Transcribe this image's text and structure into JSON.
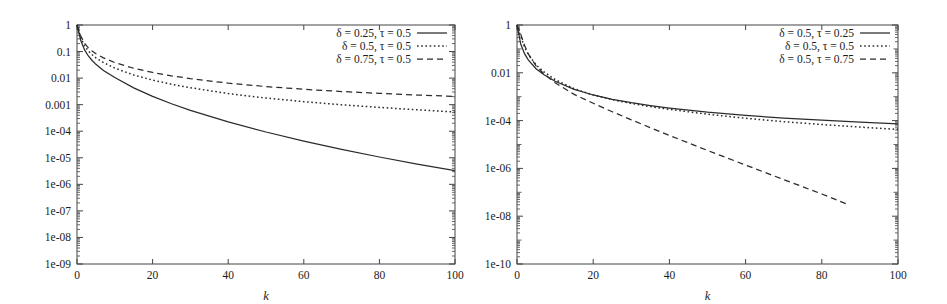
{
  "figure": {
    "background": "#ffffff",
    "ink": "#2b2b2b",
    "panel_count": 2
  },
  "chart_data": [
    {
      "type": "line",
      "id": "left-panel",
      "title": "",
      "xlabel": "k",
      "ylabel": "",
      "xlim": [
        0,
        100
      ],
      "ylim": [
        1e-09,
        1
      ],
      "yscale": "log",
      "grid": false,
      "legend_position": "top-right",
      "xticks": [
        0,
        20,
        40,
        60,
        80,
        100
      ],
      "xtick_labels": [
        "0",
        "20",
        "40",
        "60",
        "80",
        "100"
      ],
      "yticks": [
        1,
        0.1,
        0.01,
        0.001,
        0.0001,
        1e-05,
        1e-06,
        1e-07,
        1e-08,
        1e-09
      ],
      "ytick_labels": [
        "1",
        "0.1",
        "0.01",
        "0.001",
        "1e-04",
        "1e-05",
        "1e-06",
        "1e-07",
        "1e-08",
        "1e-09"
      ],
      "series": [
        {
          "name": "δ = 0.25, τ = 0.5",
          "style": "solid",
          "x": [
            0,
            1,
            2,
            3,
            4,
            5,
            7,
            10,
            15,
            20,
            25,
            30,
            40,
            50,
            60,
            70,
            80,
            90,
            100
          ],
          "values": [
            1.0,
            0.26,
            0.115,
            0.068,
            0.046,
            0.033,
            0.0195,
            0.0105,
            0.0043,
            0.00205,
            0.00108,
            0.00061,
            0.000225,
            9.35e-05,
            4.25e-05,
            2.07e-05,
            1.07e-05,
            5.8e-06,
            3.3e-06
          ]
        },
        {
          "name": "δ = 0.5, τ = 0.5",
          "style": "dotted",
          "x": [
            0,
            1,
            2,
            3,
            4,
            5,
            7,
            10,
            15,
            20,
            25,
            30,
            40,
            50,
            60,
            70,
            80,
            90,
            100
          ],
          "values": [
            1.0,
            0.33,
            0.165,
            0.105,
            0.076,
            0.058,
            0.0385,
            0.0238,
            0.0131,
            0.0084,
            0.0059,
            0.00435,
            0.00262,
            0.00178,
            0.0013,
            0.00099,
            0.00079,
            0.00064,
            0.00053
          ]
        },
        {
          "name": "δ = 0.75, τ = 0.5",
          "style": "dashed",
          "x": [
            0,
            1,
            2,
            3,
            4,
            5,
            7,
            10,
            15,
            20,
            25,
            30,
            40,
            50,
            60,
            70,
            80,
            90,
            100
          ],
          "values": [
            1.0,
            0.38,
            0.205,
            0.138,
            0.104,
            0.083,
            0.058,
            0.0385,
            0.0235,
            0.0163,
            0.0122,
            0.0096,
            0.00645,
            0.0048,
            0.0038,
            0.00313,
            0.00266,
            0.00231,
            0.00204
          ]
        }
      ]
    },
    {
      "type": "line",
      "id": "right-panel",
      "title": "",
      "xlabel": "k",
      "ylabel": "",
      "xlim": [
        0,
        100
      ],
      "ylim": [
        1e-10,
        1
      ],
      "yscale": "log",
      "grid": false,
      "legend_position": "top-right",
      "xticks": [
        0,
        20,
        40,
        60,
        80,
        100
      ],
      "xtick_labels": [
        "0",
        "20",
        "40",
        "60",
        "80",
        "100"
      ],
      "yticks": [
        1,
        0.01,
        0.0001,
        1e-06,
        1e-08,
        1e-10
      ],
      "ytick_labels": [
        "1",
        "0.01",
        "1e-04",
        "1e-06",
        "1e-08",
        "1e-10"
      ],
      "yminor_decades": [
        0.1,
        0.001,
        1e-05,
        1e-07,
        1e-09
      ],
      "series": [
        {
          "name": "δ = 0.5, τ = 0.25",
          "style": "solid",
          "x": [
            0,
            1,
            2,
            3,
            5,
            7,
            10,
            15,
            20,
            25,
            30,
            35,
            40,
            50,
            60,
            70,
            80,
            90,
            100
          ],
          "values": [
            1.0,
            0.155,
            0.062,
            0.034,
            0.0148,
            0.0085,
            0.00445,
            0.00202,
            0.00118,
            0.00078,
            0.00056,
            0.000425,
            0.000335,
            0.000225,
            0.000165,
            0.000128,
            0.000104,
            8.65e-05,
            7.35e-05
          ]
        },
        {
          "name": "δ = 0.5, τ = 0.5",
          "style": "dotted",
          "x": [
            0,
            1,
            2,
            3,
            5,
            7,
            10,
            15,
            20,
            25,
            30,
            35,
            40,
            50,
            60,
            70,
            80,
            90,
            100
          ],
          "values": [
            1.0,
            0.33,
            0.118,
            0.058,
            0.0215,
            0.0111,
            0.0052,
            0.00215,
            0.00118,
            0.00075,
            0.00052,
            0.000385,
            0.000295,
            0.000185,
            0.000125,
            9.05e-05,
            6.85e-05,
            5.35e-05,
            4.3e-05
          ]
        },
        {
          "name": "δ = 0.5, τ = 0.75",
          "style": "dashed",
          "x": [
            0,
            1,
            2,
            3,
            5,
            7,
            10,
            15,
            20,
            25,
            30,
            35,
            40,
            50,
            60,
            70,
            80,
            87
          ],
          "values": [
            1.0,
            0.4,
            0.138,
            0.06,
            0.0195,
            0.0092,
            0.0038,
            0.00125,
            0.00053,
            0.000235,
            0.000108,
            5.05e-05,
            2.4e-05,
            5.65e-06,
            1.38e-06,
            3.4e-07,
            8.5e-08,
            3e-08
          ]
        }
      ]
    }
  ]
}
